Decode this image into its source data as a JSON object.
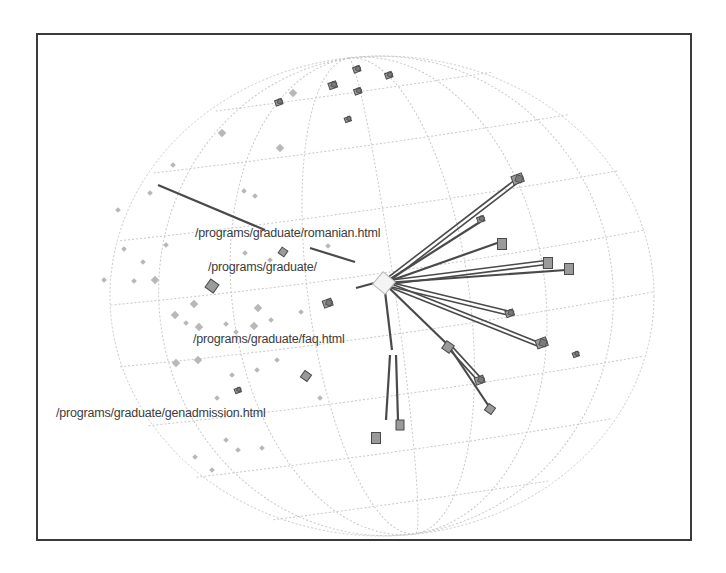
{
  "frame": {
    "x": 36,
    "y": 33,
    "w": 656,
    "h": 508
  },
  "sphere": {
    "cx": 382,
    "cy": 296,
    "rx": 272,
    "ry": 240,
    "grid_color": "#c8c8c8",
    "meridians": [
      -0.82,
      -0.55,
      -0.27,
      0.05,
      0.32,
      0.6,
      0.85
    ],
    "parallels": [
      -0.86,
      -0.64,
      -0.38,
      -0.12,
      0.14,
      0.4,
      0.64,
      0.86
    ]
  },
  "colors": {
    "edge": "#4a4a4a",
    "node_fill": "#9a9a9a",
    "node_stroke": "#4a4a4a",
    "faint_node": "#b8b8b8",
    "label": "#3c3c3c"
  },
  "focus_node": {
    "id": "graduate",
    "x": 384,
    "y": 283
  },
  "labels": [
    {
      "id": "romanian",
      "text": "/programs/graduate/romanian.html",
      "x": 195,
      "y": 234
    },
    {
      "id": "graduate",
      "text": "/programs/graduate/",
      "x": 208,
      "y": 268
    },
    {
      "id": "faq",
      "text": "/programs/graduate/faq.html",
      "x": 193,
      "y": 340
    },
    {
      "id": "genadmission",
      "text": "/programs/graduate/genadmission.html",
      "x": 56,
      "y": 414
    }
  ],
  "edges": [
    {
      "from": [
        384,
        283
      ],
      "to": [
        518,
        180
      ],
      "double": true
    },
    {
      "from": [
        384,
        283
      ],
      "to": [
        480,
        222
      ],
      "double": false
    },
    {
      "from": [
        384,
        283
      ],
      "to": [
        500,
        242
      ],
      "double": false
    },
    {
      "from": [
        384,
        283
      ],
      "to": [
        550,
        262
      ],
      "double": true
    },
    {
      "from": [
        384,
        283
      ],
      "to": [
        566,
        270
      ],
      "double": false
    },
    {
      "from": [
        384,
        283
      ],
      "to": [
        508,
        313
      ],
      "double": true
    },
    {
      "from": [
        384,
        283
      ],
      "to": [
        540,
        345
      ],
      "double": true
    },
    {
      "from": [
        384,
        283
      ],
      "to": [
        448,
        345
      ],
      "double": false
    },
    {
      "from": [
        448,
        345
      ],
      "to": [
        480,
        380
      ],
      "double": true
    },
    {
      "from": [
        448,
        345
      ],
      "to": [
        490,
        408
      ],
      "double": false
    },
    {
      "from": [
        384,
        283
      ],
      "to": [
        392,
        350
      ],
      "double": false
    },
    {
      "from": [
        390,
        355
      ],
      "to": [
        386,
        420
      ],
      "double": false
    },
    {
      "from": [
        396,
        355
      ],
      "to": [
        398,
        420
      ],
      "double": false
    },
    {
      "from": [
        158,
        185
      ],
      "to": [
        265,
        230
      ],
      "double": false
    },
    {
      "from": [
        310,
        248
      ],
      "to": [
        355,
        262
      ],
      "double": false
    },
    {
      "from": [
        356,
        288
      ],
      "to": [
        378,
        282
      ],
      "double": false
    }
  ],
  "nodes": [
    {
      "x": 518,
      "y": 180,
      "s": 11,
      "shape": "cluster"
    },
    {
      "x": 481,
      "y": 220,
      "s": 7,
      "shape": "cluster"
    },
    {
      "x": 502,
      "y": 243,
      "s": 9,
      "shape": "box"
    },
    {
      "x": 548,
      "y": 262,
      "s": 9,
      "shape": "box"
    },
    {
      "x": 569,
      "y": 268,
      "s": 9,
      "shape": "box"
    },
    {
      "x": 510,
      "y": 314,
      "s": 8,
      "shape": "cluster"
    },
    {
      "x": 542,
      "y": 344,
      "s": 11,
      "shape": "cluster"
    },
    {
      "x": 576,
      "y": 355,
      "s": 6,
      "shape": "cluster"
    },
    {
      "x": 448,
      "y": 347,
      "s": 9,
      "shape": "diamond"
    },
    {
      "x": 480,
      "y": 381,
      "s": 9,
      "shape": "cluster"
    },
    {
      "x": 490,
      "y": 409,
      "s": 8,
      "shape": "diamond"
    },
    {
      "x": 400,
      "y": 424,
      "s": 8,
      "shape": "box"
    },
    {
      "x": 376,
      "y": 437,
      "s": 9,
      "shape": "box"
    },
    {
      "x": 212,
      "y": 286,
      "s": 10,
      "shape": "diamond"
    },
    {
      "x": 283,
      "y": 252,
      "s": 7,
      "shape": "diamond"
    },
    {
      "x": 328,
      "y": 304,
      "s": 9,
      "shape": "cluster"
    },
    {
      "x": 306,
      "y": 376,
      "s": 8,
      "shape": "diamond"
    },
    {
      "x": 238,
      "y": 391,
      "s": 6,
      "shape": "cluster"
    },
    {
      "x": 279,
      "y": 103,
      "s": 7,
      "shape": "cluster"
    },
    {
      "x": 333,
      "y": 86,
      "s": 8,
      "shape": "cluster"
    },
    {
      "x": 357,
      "y": 70,
      "s": 7,
      "shape": "cluster"
    },
    {
      "x": 358,
      "y": 92,
      "s": 7,
      "shape": "cluster"
    },
    {
      "x": 389,
      "y": 76,
      "s": 7,
      "shape": "cluster"
    },
    {
      "x": 348,
      "y": 120,
      "s": 6,
      "shape": "cluster"
    }
  ],
  "faint_nodes": [
    [
      293,
      93,
      3
    ],
    [
      222,
      133,
      3
    ],
    [
      280,
      148,
      3
    ],
    [
      173,
      165,
      2
    ],
    [
      244,
      191,
      2
    ],
    [
      150,
      193,
      2
    ],
    [
      255,
      196,
      2
    ],
    [
      118,
      210,
      2
    ],
    [
      124,
      249,
      2
    ],
    [
      143,
      262,
      2
    ],
    [
      155,
      280,
      3
    ],
    [
      194,
      304,
      3
    ],
    [
      175,
      315,
      3
    ],
    [
      186,
      323,
      2
    ],
    [
      245,
      253,
      2
    ],
    [
      226,
      324,
      2
    ],
    [
      254,
      326,
      3
    ],
    [
      258,
      308,
      3
    ],
    [
      236,
      332,
      2
    ],
    [
      270,
      260,
      2
    ],
    [
      328,
      246,
      2
    ],
    [
      257,
      370,
      2
    ],
    [
      277,
      360,
      2
    ],
    [
      232,
      375,
      2
    ],
    [
      176,
      363,
      3
    ],
    [
      198,
      360,
      3
    ],
    [
      217,
      398,
      2
    ],
    [
      226,
      440,
      2
    ],
    [
      238,
      450,
      2
    ],
    [
      212,
      470,
      2
    ],
    [
      262,
      448,
      2
    ],
    [
      195,
      457,
      2
    ],
    [
      320,
      398,
      2
    ],
    [
      134,
      281,
      2
    ],
    [
      104,
      280,
      2
    ],
    [
      166,
      245,
      2
    ],
    [
      199,
      327,
      3
    ],
    [
      271,
      320,
      2
    ],
    [
      301,
      312,
      2
    ]
  ]
}
